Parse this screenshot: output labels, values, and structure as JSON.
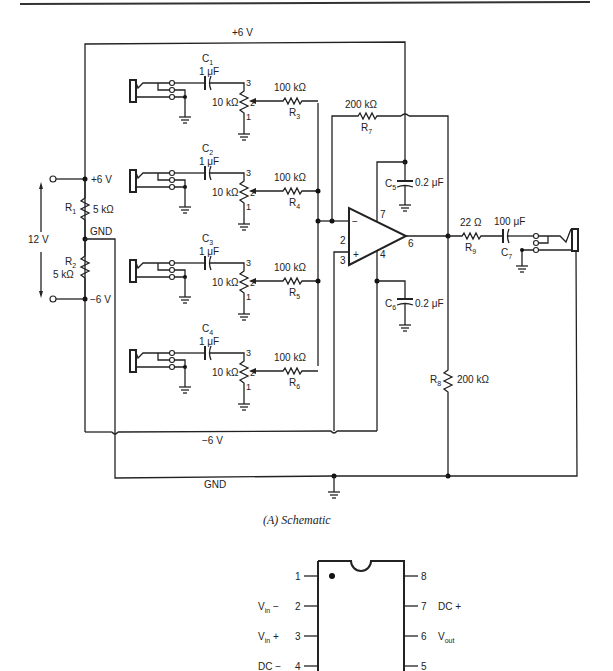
{
  "figure": {
    "caption": "(A) Schematic",
    "rule": "top-rule"
  },
  "schematic": {
    "rails": {
      "pos": "+6 V",
      "neg": "−6 V",
      "gnd": "GND",
      "supply": "12 V"
    },
    "divider": {
      "node_pos": "+6 V",
      "node_gnd": "GND",
      "node_neg": "−6 V",
      "R1": {
        "name": "R",
        "sub": "1",
        "value": "5 kΩ"
      },
      "R2": {
        "name": "R",
        "sub": "2",
        "value": "5 kΩ"
      }
    },
    "inputs": [
      {
        "cap": {
          "name": "C",
          "sub": "1",
          "value": "1 μF"
        },
        "pot": "10 kΩ",
        "res": {
          "name": "R",
          "sub": "3",
          "value": "100 kΩ"
        },
        "pins": [
          "3",
          "2",
          "1"
        ]
      },
      {
        "cap": {
          "name": "C",
          "sub": "2",
          "value": "1 μF"
        },
        "pot": "10 kΩ",
        "res": {
          "name": "R",
          "sub": "4",
          "value": "100 kΩ"
        },
        "pins": [
          "3",
          "2",
          "1"
        ]
      },
      {
        "cap": {
          "name": "C",
          "sub": "3",
          "value": "1 μF"
        },
        "pot": "10 kΩ",
        "res": {
          "name": "R",
          "sub": "5",
          "value": "100 kΩ"
        },
        "pins": [
          "3",
          "2",
          "1"
        ]
      },
      {
        "cap": {
          "name": "C",
          "sub": "4",
          "value": "1 μF"
        },
        "pot": "10 kΩ",
        "res": {
          "name": "R",
          "sub": "6",
          "value": "100 kΩ"
        },
        "pins": [
          "3",
          "2",
          "1"
        ]
      }
    ],
    "feedback": {
      "name": "R",
      "sub": "7",
      "value": "200 kΩ"
    },
    "C5": {
      "name": "C",
      "sub": "5",
      "value": "0.2 μF"
    },
    "C6": {
      "name": "C",
      "sub": "6",
      "value": "0.2 μF"
    },
    "R8": {
      "name": "R",
      "sub": "8",
      "value": "200 kΩ"
    },
    "R9": {
      "name": "R",
      "sub": "9",
      "value": "22 Ω"
    },
    "C7": {
      "name": "C",
      "sub": "7",
      "value": "100 μF"
    },
    "opamp": {
      "minus": "−",
      "plus": "+",
      "pin_inv": "2",
      "pin_noninv": "3",
      "pin_out": "6",
      "pin_vpos": "7",
      "pin_vneg": "4"
    }
  },
  "pinout": {
    "left": [
      {
        "num": "1",
        "label": ""
      },
      {
        "num": "2",
        "label": "V",
        "sub": "in",
        "suffix": " −"
      },
      {
        "num": "3",
        "label": "V",
        "sub": "in",
        "suffix": " +"
      },
      {
        "num": "4",
        "label": "DC −",
        "sub": "",
        "suffix": ""
      }
    ],
    "right": [
      {
        "num": "8",
        "label": ""
      },
      {
        "num": "7",
        "label": "DC +"
      },
      {
        "num": "6",
        "label": "V",
        "sub": "out"
      },
      {
        "num": "5",
        "label": ""
      }
    ]
  }
}
